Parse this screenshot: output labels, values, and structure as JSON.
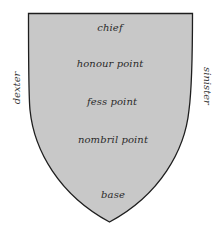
{
  "diagram": {
    "type": "heraldic-shield-points",
    "shield": {
      "fill": "#c8c8c8",
      "stroke": "#1e1e1e"
    },
    "points": [
      {
        "id": "chief",
        "label": "chief"
      },
      {
        "id": "honour",
        "label": "honour point"
      },
      {
        "id": "fess",
        "label": "fess point"
      },
      {
        "id": "nombril",
        "label": "nombril point"
      },
      {
        "id": "base",
        "label": "base"
      }
    ],
    "sides": {
      "left": "dexter",
      "right": "sinister"
    }
  }
}
